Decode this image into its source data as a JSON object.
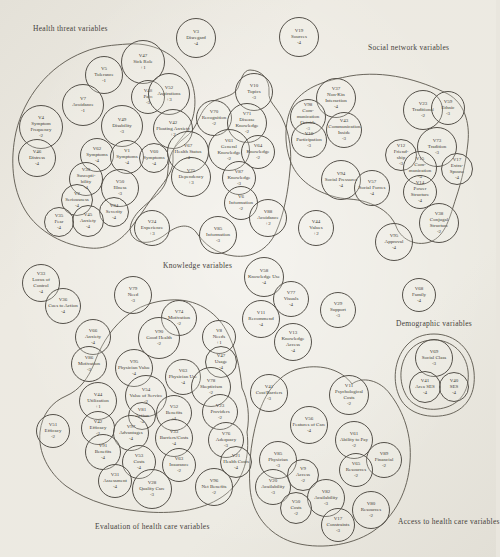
{
  "figure": {
    "type": "variable-cluster-diagram",
    "ink_color": "#45423a",
    "paper_color": "#e9e6de"
  },
  "clusters": [
    {
      "id": "health-threat",
      "label": "Health threat variables"
    },
    {
      "id": "social-network",
      "label": "Social network variables"
    },
    {
      "id": "knowledge",
      "label": "Knowledge variables"
    },
    {
      "id": "demographic",
      "label": "Demographic variables"
    },
    {
      "id": "evaluation",
      "label": "Evaluation of health care variables"
    },
    {
      "id": "access",
      "label": "Access to health care variables"
    }
  ],
  "nodes": [
    {
      "code": "V3",
      "name": "Disregard",
      "value": "-4",
      "x": 196,
      "y": 38,
      "r": 20,
      "group": "free-top"
    },
    {
      "code": "V19",
      "name": "Sources",
      "value": "-4",
      "x": 299,
      "y": 37,
      "r": 20,
      "group": "free-top"
    },
    {
      "code": "V5",
      "name": "Tolerance",
      "value": "-1",
      "x": 104,
      "y": 75,
      "r": 19,
      "group": "health-threat"
    },
    {
      "code": "V47",
      "name": "Sick Role",
      "value": "+1",
      "x": 143,
      "y": 62,
      "r": 22,
      "group": "health-threat"
    },
    {
      "code": "V48",
      "name": "Pain",
      "value": "-3",
      "x": 148,
      "y": 97,
      "r": 17,
      "group": "health-threat"
    },
    {
      "code": "V7",
      "name": "Avoidance",
      "value": "-1",
      "x": 83,
      "y": 105,
      "r": 21,
      "group": "health-threat"
    },
    {
      "code": "V52",
      "name": "Aspirations",
      "value": "+3",
      "x": 169,
      "y": 94,
      "r": 21,
      "group": "health-threat"
    },
    {
      "code": "V4",
      "name": "Symptom Frequency",
      "value": "-2",
      "x": 41,
      "y": 127,
      "r": 22,
      "group": "health-threat"
    },
    {
      "code": "V49",
      "name": "Disability",
      "value": "-3",
      "x": 122,
      "y": 126,
      "r": 21,
      "group": "health-threat"
    },
    {
      "code": "V42",
      "name": "Floating Anxiety",
      "value": "+2",
      "x": 173,
      "y": 129,
      "r": 20,
      "group": "health-threat"
    },
    {
      "code": "V46",
      "name": "Distress",
      "value": "-4",
      "x": 37,
      "y": 158,
      "r": 19,
      "group": "health-threat"
    },
    {
      "code": "V62",
      "name": "Symptoms",
      "value": "-4",
      "x": 97,
      "y": 155,
      "r": 17,
      "group": "health-threat"
    },
    {
      "code": "V1",
      "name": "Symptoms",
      "value": "-4",
      "x": 127,
      "y": 157,
      "r": 17,
      "group": "health-threat"
    },
    {
      "code": "V60",
      "name": "Symptoms",
      "value": "-4",
      "x": 154,
      "y": 158,
      "r": 15,
      "group": "health-threat"
    },
    {
      "code": "V30",
      "name": "Suscepti- bility",
      "value": "-4",
      "x": 86,
      "y": 179,
      "r": 17,
      "group": "health-threat"
    },
    {
      "code": "V50",
      "name": "Illness",
      "value": "-3",
      "x": 120,
      "y": 188,
      "r": 19,
      "group": "health-threat"
    },
    {
      "code": "V2",
      "name": "Seriousness",
      "value": "-4",
      "x": 77,
      "y": 200,
      "r": 16,
      "group": "health-threat"
    },
    {
      "code": "V34",
      "name": "Severity",
      "value": "-4",
      "x": 114,
      "y": 212,
      "r": 15,
      "group": "health-threat"
    },
    {
      "code": "V45",
      "name": "Anxiety",
      "value": "-4",
      "x": 88,
      "y": 221,
      "r": 16,
      "group": "health-threat"
    },
    {
      "code": "V35",
      "name": "Fear",
      "value": "-4",
      "x": 59,
      "y": 222,
      "r": 15,
      "group": "health-threat"
    },
    {
      "code": "V67",
      "name": "Health Status",
      "value": "-4",
      "x": 188,
      "y": 152,
      "r": 21,
      "group": "knowledge"
    },
    {
      "code": "V75",
      "name": "Dependency",
      "value": "+3",
      "x": 191,
      "y": 177,
      "r": 20,
      "group": "knowledge"
    },
    {
      "code": "V24",
      "name": "Experience",
      "value": "+3",
      "x": 152,
      "y": 228,
      "r": 18,
      "group": "knowledge"
    },
    {
      "code": "V10",
      "name": "Topics",
      "value": "-3",
      "x": 254,
      "y": 92,
      "r": 19,
      "group": "knowledge"
    },
    {
      "code": "V70",
      "name": "Recognition",
      "value": "-2",
      "x": 214,
      "y": 118,
      "r": 18,
      "group": "knowledge"
    },
    {
      "code": "V71",
      "name": "Disease Knowledge",
      "value": "-2",
      "x": 247,
      "y": 123,
      "r": 20,
      "group": "knowledge"
    },
    {
      "code": "V61",
      "name": "General Knowledge",
      "value": "-2",
      "x": 229,
      "y": 150,
      "r": 21,
      "group": "knowledge"
    },
    {
      "code": "V64",
      "name": "Knowledge",
      "value": "-2",
      "x": 258,
      "y": 152,
      "r": 17,
      "group": "knowledge"
    },
    {
      "code": "V87",
      "name": "Knowledge",
      "value": "-3",
      "x": 239,
      "y": 178,
      "r": 17,
      "group": "knowledge"
    },
    {
      "code": "V6",
      "name": "Information",
      "value": "-2",
      "x": 241,
      "y": 203,
      "r": 17,
      "group": "knowledge"
    },
    {
      "code": "V88",
      "name": "Avoidance",
      "value": "+2",
      "x": 268,
      "y": 218,
      "r": 19,
      "group": "knowledge"
    },
    {
      "code": "V85",
      "name": "Information",
      "value": "-3",
      "x": 218,
      "y": 235,
      "r": 19,
      "group": "knowledge"
    },
    {
      "code": "V37",
      "name": "Non-Kin Interaction",
      "value": "-4",
      "x": 336,
      "y": 98,
      "r": 20,
      "group": "social-network"
    },
    {
      "code": "V98",
      "name": "Com- munication Outside",
      "value": "-3",
      "x": 308,
      "y": 117,
      "r": 18,
      "group": "social-network"
    },
    {
      "code": "V43",
      "name": "Communication Inside",
      "value": "-3",
      "x": 344,
      "y": 130,
      "r": 18,
      "group": "social-network"
    },
    {
      "code": "V16",
      "name": "Participation",
      "value": "-3",
      "x": 309,
      "y": 140,
      "r": 18,
      "group": "social-network"
    },
    {
      "code": "V23",
      "name": "Traditional",
      "value": "-2",
      "x": 423,
      "y": 110,
      "r": 20,
      "group": "social-network"
    },
    {
      "code": "V59",
      "name": "Ethnic",
      "value": "-3",
      "x": 448,
      "y": 108,
      "r": 17,
      "group": "social-network"
    },
    {
      "code": "V73",
      "name": "Tradition",
      "value": "-3",
      "x": 437,
      "y": 147,
      "r": 20,
      "group": "social-network"
    },
    {
      "code": "V12",
      "name": "Friend- ship",
      "value": "-3",
      "x": 401,
      "y": 155,
      "r": 16,
      "group": "social-network"
    },
    {
      "code": "V15",
      "name": "Com- munication",
      "value": "-4",
      "x": 420,
      "y": 168,
      "r": 17,
      "group": "social-network"
    },
    {
      "code": "V17",
      "name": "Extra- Spouse",
      "value": "-4",
      "x": 457,
      "y": 169,
      "r": 16,
      "group": "social-network"
    },
    {
      "code": "V14",
      "name": "Power Structure",
      "value": "-4",
      "x": 420,
      "y": 192,
      "r": 17,
      "group": "social-network"
    },
    {
      "code": "V94",
      "name": "Social Pressures",
      "value": "-4",
      "x": 341,
      "y": 180,
      "r": 20,
      "group": "social-network"
    },
    {
      "code": "V57",
      "name": "Social Forces",
      "value": "-4",
      "x": 372,
      "y": 188,
      "r": 18,
      "group": "social-network"
    },
    {
      "code": "V38",
      "name": "Conjugal Structure",
      "value": "-2",
      "x": 439,
      "y": 223,
      "r": 20,
      "group": "social-network"
    },
    {
      "code": "V44",
      "name": "Values",
      "value": "+2",
      "x": 316,
      "y": 228,
      "r": 18,
      "group": "free-middle"
    },
    {
      "code": "V95",
      "name": "Approval",
      "value": "-4",
      "x": 394,
      "y": 242,
      "r": 19,
      "group": "free-middle"
    },
    {
      "code": "V58",
      "name": "Knowledge Use",
      "value": "-4",
      "x": 264,
      "y": 277,
      "r": 20,
      "group": "free-middle"
    },
    {
      "code": "V77",
      "name": "Visuals",
      "value": "-4",
      "x": 291,
      "y": 299,
      "r": 18,
      "group": "free-middle"
    },
    {
      "code": "V29",
      "name": "Support",
      "value": "-3",
      "x": 338,
      "y": 310,
      "r": 18,
      "group": "free-middle"
    },
    {
      "code": "V11",
      "name": "Recommend",
      "value": "-4",
      "x": 261,
      "y": 319,
      "r": 19,
      "group": "free-middle"
    },
    {
      "code": "V13",
      "name": "Knowledge Access",
      "value": "-4",
      "x": 293,
      "y": 342,
      "r": 19,
      "group": "free-middle"
    },
    {
      "code": "V68",
      "name": "Family",
      "value": "-4",
      "x": 419,
      "y": 295,
      "r": 17,
      "group": "free-middle"
    },
    {
      "code": "V69",
      "name": "Social Class",
      "value": "-3",
      "x": 434,
      "y": 358,
      "r": 19,
      "group": "demographic"
    },
    {
      "code": "V41",
      "name": "Area SES",
      "value": "-4",
      "x": 425,
      "y": 387,
      "r": 16,
      "group": "demographic"
    },
    {
      "code": "V40",
      "name": "SES",
      "value": "-4",
      "x": 454,
      "y": 387,
      "r": 15,
      "group": "demographic"
    },
    {
      "code": "V33",
      "name": "Locus of Control",
      "value": "-4",
      "x": 41,
      "y": 283,
      "r": 19,
      "group": "free-left"
    },
    {
      "code": "V36",
      "name": "Cues to Action",
      "value": "-4",
      "x": 63,
      "y": 306,
      "r": 18,
      "group": "free-left"
    },
    {
      "code": "V66",
      "name": "Anxiety",
      "value": "-4",
      "x": 93,
      "y": 337,
      "r": 18,
      "group": "free-left"
    },
    {
      "code": "V86",
      "name": "Motivation",
      "value": "-3",
      "x": 89,
      "y": 364,
      "r": 18,
      "group": "free-left"
    },
    {
      "code": "V79",
      "name": "Need",
      "value": "-3",
      "x": 133,
      "y": 295,
      "r": 19,
      "group": "free-left"
    },
    {
      "code": "V74",
      "name": "Motivation",
      "value": "-2",
      "x": 179,
      "y": 318,
      "r": 18,
      "group": "evaluation"
    },
    {
      "code": "V90",
      "name": "Good Health",
      "value": "-2",
      "x": 159,
      "y": 338,
      "r": 21,
      "group": "evaluation"
    },
    {
      "code": "V8",
      "name": "Needs",
      "value": "+1",
      "x": 219,
      "y": 337,
      "r": 17,
      "group": "evaluation"
    },
    {
      "code": "V95",
      "name": "Physician Value",
      "value": "-4",
      "x": 134,
      "y": 368,
      "r": 19,
      "group": "evaluation"
    },
    {
      "code": "V63",
      "name": "Physician Use",
      "value": "-4",
      "x": 183,
      "y": 377,
      "r": 18,
      "group": "evaluation"
    },
    {
      "code": "V47",
      "name": "Usage",
      "value": "-4",
      "x": 221,
      "y": 362,
      "r": 16,
      "group": "evaluation"
    },
    {
      "code": "V78",
      "name": "Skepticism",
      "value": "-2",
      "x": 211,
      "y": 387,
      "r": 20,
      "group": "evaluation"
    },
    {
      "code": "V54",
      "name": "Value of Service",
      "value": "-2",
      "x": 146,
      "y": 396,
      "r": 21,
      "group": "evaluation"
    },
    {
      "code": "V44",
      "name": "Utilization",
      "value": "+1",
      "x": 98,
      "y": 401,
      "r": 19,
      "group": "evaluation"
    },
    {
      "code": "V51",
      "name": "Efficacy",
      "value": "-2",
      "x": 53,
      "y": 431,
      "r": 17,
      "group": "evaluation"
    },
    {
      "code": "V42",
      "name": "Efficacy",
      "value": "-2",
      "x": 98,
      "y": 428,
      "r": 17,
      "group": "evaluation"
    },
    {
      "code": "V81",
      "name": "Action",
      "value": "-4",
      "x": 142,
      "y": 416,
      "r": 14,
      "group": "evaluation"
    },
    {
      "code": "V97",
      "name": "Advantages",
      "value": "-4",
      "x": 131,
      "y": 433,
      "r": 18,
      "group": "evaluation"
    },
    {
      "code": "V52",
      "name": "Benefits",
      "value": "-4",
      "x": 174,
      "y": 413,
      "r": 18,
      "group": "evaluation"
    },
    {
      "code": "V91",
      "name": "Benefits",
      "value": "-4",
      "x": 103,
      "y": 452,
      "r": 18,
      "group": "evaluation"
    },
    {
      "code": "V33",
      "name": "Barriers/Costs",
      "value": "-4",
      "x": 174,
      "y": 438,
      "r": 19,
      "group": "evaluation"
    },
    {
      "code": "V53",
      "name": "Costs",
      "value": "-4",
      "x": 139,
      "y": 462,
      "r": 17,
      "group": "evaluation"
    },
    {
      "code": "V31",
      "name": "Assessment",
      "value": "-4",
      "x": 115,
      "y": 481,
      "r": 17,
      "group": "evaluation"
    },
    {
      "code": "V28",
      "name": "Quality Care",
      "value": "-3",
      "x": 152,
      "y": 489,
      "r": 20,
      "group": "evaluation"
    },
    {
      "code": "V63",
      "name": "Insurance",
      "value": "-2",
      "x": 179,
      "y": 465,
      "r": 17,
      "group": "evaluation"
    },
    {
      "code": "V23",
      "name": "Providers",
      "value": "-2",
      "x": 220,
      "y": 412,
      "r": 18,
      "group": "evaluation"
    },
    {
      "code": "V76",
      "name": "Adequacy",
      "value": "-3",
      "x": 226,
      "y": 440,
      "r": 18,
      "group": "evaluation"
    },
    {
      "code": "V21",
      "name": "Health Costs",
      "value": "-4",
      "x": 236,
      "y": 462,
      "r": 16,
      "group": "evaluation"
    },
    {
      "code": "V96",
      "name": "Net Benefits",
      "value": "-2",
      "x": 214,
      "y": 487,
      "r": 19,
      "group": "evaluation"
    },
    {
      "code": "V41",
      "name": "Cost/Barriers",
      "value": "-3",
      "x": 269,
      "y": 393,
      "r": 19,
      "group": "access"
    },
    {
      "code": "V11",
      "name": "Psychological Costs",
      "value": "-2",
      "x": 349,
      "y": 395,
      "r": 20,
      "group": "access"
    },
    {
      "code": "V56",
      "name": "Features of Care",
      "value": "-4",
      "x": 309,
      "y": 425,
      "r": 19,
      "group": "access"
    },
    {
      "code": "V61",
      "name": "Ability to Pay",
      "value": "-2",
      "x": 354,
      "y": 440,
      "r": 19,
      "group": "access"
    },
    {
      "code": "V89",
      "name": "Financial",
      "value": "-2",
      "x": 384,
      "y": 460,
      "r": 18,
      "group": "access"
    },
    {
      "code": "V65",
      "name": "Resources",
      "value": "-2",
      "x": 356,
      "y": 470,
      "r": 17,
      "group": "access"
    },
    {
      "code": "V85",
      "name": "Physician",
      "value": "-3",
      "x": 278,
      "y": 460,
      "r": 19,
      "group": "access"
    },
    {
      "code": "V9",
      "name": "Access",
      "value": "-2",
      "x": 303,
      "y": 475,
      "r": 16,
      "group": "access"
    },
    {
      "code": "V20",
      "name": "Availability",
      "value": "-3",
      "x": 273,
      "y": 487,
      "r": 18,
      "group": "access"
    },
    {
      "code": "V82",
      "name": "Availability",
      "value": "-3",
      "x": 326,
      "y": 498,
      "r": 19,
      "group": "access"
    },
    {
      "code": "V50",
      "name": "Costs",
      "value": "-2",
      "x": 296,
      "y": 508,
      "r": 16,
      "group": "access"
    },
    {
      "code": "V80",
      "name": "Resources",
      "value": "-2",
      "x": 371,
      "y": 510,
      "r": 19,
      "group": "access"
    },
    {
      "code": "V17",
      "name": "Constraints",
      "value": "-3",
      "x": 338,
      "y": 525,
      "r": 17,
      "group": "access"
    }
  ]
}
